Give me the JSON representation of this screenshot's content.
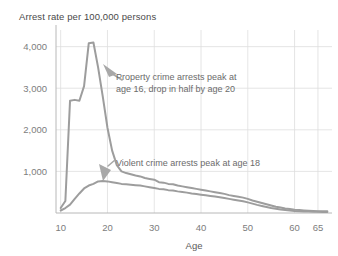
{
  "chart_data": {
    "type": "line",
    "title": "Arrest rate per 100,000 persons",
    "xlabel": "Age",
    "ylabel": "",
    "xlim": [
      9,
      68
    ],
    "ylim": [
      0,
      4400
    ],
    "grid": true,
    "legend_position": "none",
    "xticks": [
      10,
      20,
      30,
      40,
      50,
      60,
      65
    ],
    "xtick_labels": [
      "10",
      "20",
      "30",
      "40",
      "50",
      "60",
      "65"
    ],
    "yticks": [
      1000,
      2000,
      3000,
      4000
    ],
    "ytick_labels": [
      "1,000",
      "2,000",
      "3,000",
      "4,000"
    ],
    "x": [
      10,
      11,
      12,
      13,
      14,
      15,
      16,
      17,
      18,
      19,
      20,
      21,
      22,
      23,
      24,
      25,
      26,
      27,
      28,
      29,
      30,
      31,
      32,
      33,
      34,
      35,
      36,
      37,
      38,
      39,
      40,
      41,
      42,
      43,
      44,
      45,
      46,
      47,
      48,
      49,
      50,
      51,
      52,
      53,
      54,
      55,
      56,
      57,
      58,
      59,
      60,
      61,
      62,
      63,
      64,
      65,
      66,
      67
    ],
    "series": [
      {
        "name": "Property crime",
        "color": "#9d9d9d",
        "values": [
          120,
          290,
          2700,
          2720,
          2700,
          3050,
          4080,
          4100,
          3500,
          2800,
          2050,
          1500,
          1150,
          1000,
          960,
          930,
          900,
          880,
          840,
          820,
          800,
          740,
          730,
          700,
          690,
          660,
          640,
          620,
          600,
          580,
          560,
          540,
          520,
          500,
          480,
          460,
          430,
          410,
          390,
          370,
          340,
          300,
          270,
          240,
          210,
          180,
          150,
          130,
          110,
          95,
          80,
          70,
          62,
          55,
          50,
          45,
          42,
          40
        ]
      },
      {
        "name": "Violent crime",
        "color": "#9d9d9d",
        "values": [
          60,
          120,
          200,
          340,
          470,
          590,
          660,
          700,
          760,
          770,
          760,
          740,
          720,
          700,
          690,
          680,
          670,
          660,
          640,
          620,
          600,
          580,
          570,
          550,
          540,
          520,
          505,
          490,
          470,
          455,
          440,
          425,
          410,
          395,
          380,
          360,
          340,
          320,
          300,
          280,
          255,
          225,
          195,
          170,
          145,
          120,
          100,
          85,
          72,
          60,
          50,
          44,
          38,
          34,
          30,
          28,
          26,
          25
        ]
      }
    ],
    "annotations": [
      {
        "id": "property-annotation",
        "lines": [
          "Property crime arrests peak at",
          "age 16, drop in half by age 20"
        ],
        "text": "Property crime arrests peak at age 16, drop in half by age 20"
      },
      {
        "id": "violent-annotation",
        "lines": [
          "Violent crime arrests peak at age 18"
        ],
        "text": "Violent crime arrests peak at age 18"
      }
    ]
  },
  "colors": {
    "line": "#9d9d9d",
    "grid": "#dedede",
    "axis": "#b8b8b8",
    "title_text": "#4a4a4a",
    "tick_text": "#7d7d7d",
    "annotation_text": "#6b6b6b",
    "background": "#ffffff"
  }
}
